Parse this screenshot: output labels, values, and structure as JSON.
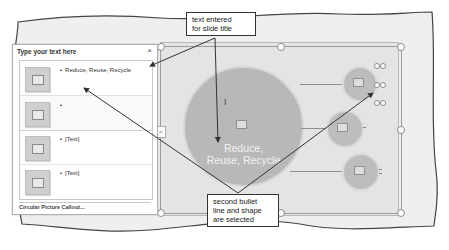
{
  "text_pane": {
    "title": "Type your text here",
    "close_glyph": "×",
    "items": [
      {
        "bullet": "Reduce, Reuse, Recycle",
        "selected": false
      },
      {
        "bullet": "",
        "selected": true
      },
      {
        "bullet": "[Text]",
        "selected": false
      },
      {
        "bullet": "[Text]",
        "selected": false
      }
    ],
    "footer": "Circular Picture Callout..."
  },
  "slide": {
    "main_shape_text_line1": "Reduce,",
    "main_shape_text_line2": "Reuse, Recycle",
    "expand_glyph": "<"
  },
  "callouts": {
    "top": {
      "line1": "text entered",
      "line2": "for slide title"
    },
    "bottom": {
      "line1": "second bullet",
      "line2": "line and shape",
      "line3": "are selected"
    }
  },
  "colors": {
    "shape_fill": "#b8b8b8",
    "slide_bg": "#e4e4e4",
    "callout_border": "#333333"
  }
}
